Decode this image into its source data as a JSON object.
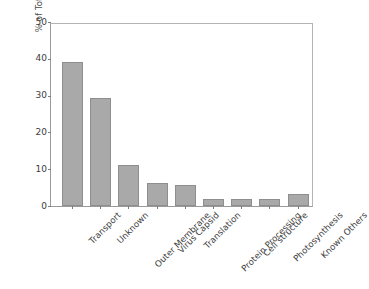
{
  "chart_data": {
    "type": "bar",
    "title": "",
    "subtitle": "",
    "xlabel": "",
    "ylabel": "% of Total",
    "ylim": [
      0,
      50
    ],
    "yticks": [
      0,
      10,
      20,
      30,
      40,
      50
    ],
    "ytick_labels": [
      "0",
      "10",
      "20",
      "30",
      "40",
      "50"
    ],
    "grid": false,
    "legend": false,
    "legend_position": "none",
    "bar_color": "#a9a9a9",
    "bar_edge_color": "#8e8e8e",
    "axis_color": "#9a9a9a",
    "text_color": "#3d3d3d",
    "categories": [
      "Transport",
      "Unknown",
      "Outer Membrane",
      "Virus Capsid",
      "Translation",
      "Protein Processing",
      "Cell structure",
      "Photosynthesis",
      "Known Others"
    ],
    "values": [
      39.1,
      29.4,
      11.2,
      6.3,
      5.6,
      1.8,
      1.9,
      1.9,
      3.2
    ]
  }
}
